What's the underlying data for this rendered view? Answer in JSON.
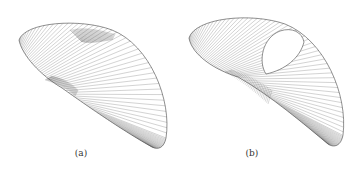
{
  "figure": {
    "panels": [
      {
        "id": "a",
        "caption": "(a)",
        "description": "ruled surface with dense line regions, no hole"
      },
      {
        "id": "b",
        "caption": "(b)",
        "description": "ruled surface with teardrop-shaped hole"
      }
    ],
    "colors": {
      "line": "#555555",
      "outline": "#444444",
      "background": "#ffffff"
    }
  }
}
